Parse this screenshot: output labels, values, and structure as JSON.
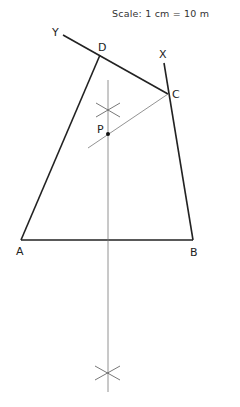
{
  "scale": {
    "text": "Scale: 1 cm = 10 m"
  },
  "points": {
    "A": {
      "label": "A",
      "x": 21,
      "y": 240
    },
    "B": {
      "label": "B",
      "x": 193,
      "y": 240
    },
    "C": {
      "label": "C",
      "x": 168,
      "y": 94
    },
    "D": {
      "label": "D",
      "x": 100,
      "y": 55
    },
    "P": {
      "label": "P",
      "x": 108,
      "y": 134
    }
  },
  "rays": {
    "Y": {
      "label": "Y"
    },
    "X": {
      "label": "X"
    }
  },
  "colors": {
    "ink": "#222222",
    "construction": "#666666",
    "background": "#ffffff"
  }
}
